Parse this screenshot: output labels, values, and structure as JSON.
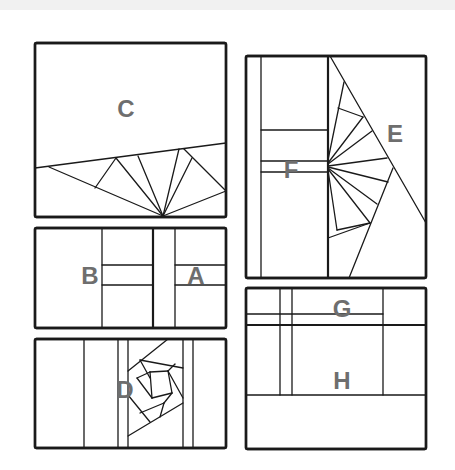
{
  "colors": {
    "stroke": "#1a1a1a",
    "label": "#6e6e6e",
    "background": "#ffffff",
    "top_band": "#f1f1f1"
  },
  "panels": [
    {
      "id": "panel-c",
      "frame": [
        35,
        43,
        191,
        174
      ],
      "labels": [
        {
          "text": "C",
          "x": 126,
          "y": 108
        }
      ],
      "thick_lines": [],
      "lines": [
        [
          35,
          168,
          226,
          143
        ],
        [
          49,
          167,
          163,
          216
        ],
        [
          116,
          158,
          95,
          188
        ],
        [
          116,
          158,
          163,
          216
        ],
        [
          138,
          156,
          163,
          216
        ],
        [
          179,
          149,
          163,
          216
        ],
        [
          184,
          149,
          226,
          191
        ],
        [
          192,
          158,
          163,
          216
        ],
        [
          163,
          216,
          226,
          191
        ]
      ]
    },
    {
      "id": "panel-b-a",
      "frame": [
        35,
        228,
        191,
        100
      ],
      "labels": [
        {
          "text": "B",
          "x": 90,
          "y": 275
        },
        {
          "text": "A",
          "x": 196,
          "y": 275
        }
      ],
      "thick_lines": [
        [
          153,
          228,
          153,
          328
        ]
      ],
      "lines": [
        [
          102,
          228,
          102,
          328
        ],
        [
          175,
          228,
          175,
          328
        ],
        [
          102,
          265,
          153,
          265
        ],
        [
          102,
          285,
          153,
          285
        ],
        [
          175,
          265,
          226,
          265
        ],
        [
          175,
          285,
          226,
          285
        ]
      ]
    },
    {
      "id": "panel-d",
      "frame": [
        35,
        339,
        191,
        109
      ],
      "labels": [
        {
          "text": "D",
          "x": 125,
          "y": 389
        }
      ],
      "thick_lines": [],
      "lines": [
        [
          84,
          339,
          84,
          448
        ],
        [
          118,
          339,
          118,
          448
        ],
        [
          128,
          339,
          128,
          448
        ],
        [
          183,
          339,
          183,
          448
        ],
        [
          193,
          339,
          193,
          448
        ],
        [
          128,
          371,
          168,
          339
        ],
        [
          140,
          360,
          183,
          368
        ],
        [
          140,
          360,
          150,
          378
        ],
        [
          150,
          372,
          168,
          371
        ],
        [
          168,
          371,
          183,
          398
        ],
        [
          175,
          364,
          168,
          371
        ],
        [
          137,
          378,
          150,
          372
        ],
        [
          137,
          378,
          152,
          398
        ],
        [
          150,
          372,
          152,
          398
        ],
        [
          152,
          398,
          172,
          393
        ],
        [
          168,
          371,
          172,
          393
        ],
        [
          172,
          393,
          164,
          403
        ],
        [
          128,
          395,
          150,
          422
        ],
        [
          140,
          413,
          164,
          403
        ],
        [
          164,
          403,
          160,
          417
        ],
        [
          128,
          436,
          183,
          403
        ]
      ]
    },
    {
      "id": "panel-f-e",
      "frame": [
        246,
        56,
        180,
        222
      ],
      "labels": [
        {
          "text": "F",
          "x": 291,
          "y": 169
        },
        {
          "text": "E",
          "x": 395,
          "y": 133
        }
      ],
      "thick_lines": [
        [
          328,
          56,
          328,
          278
        ]
      ],
      "lines": [
        [
          261,
          56,
          261,
          278
        ],
        [
          261,
          130,
          328,
          130
        ],
        [
          261,
          161,
          328,
          161
        ],
        [
          261,
          172,
          328,
          172
        ],
        [
          330,
          56,
          426,
          223
        ],
        [
          349,
          278,
          393,
          168
        ],
        [
          344,
          82,
          328,
          160
        ],
        [
          338,
          108,
          363,
          117
        ],
        [
          363,
          117,
          328,
          163
        ],
        [
          372,
          131,
          328,
          164
        ],
        [
          387,
          158,
          328,
          166
        ],
        [
          328,
          167,
          388,
          182
        ],
        [
          328,
          168,
          377,
          204
        ],
        [
          328,
          169,
          370,
          223
        ],
        [
          328,
          170,
          337,
          230
        ],
        [
          337,
          230,
          370,
          223
        ],
        [
          328,
          238,
          370,
          223
        ]
      ]
    },
    {
      "id": "panel-g-h",
      "frame": [
        246,
        288,
        180,
        161
      ],
      "labels": [
        {
          "text": "G",
          "x": 342,
          "y": 308
        },
        {
          "text": "H",
          "x": 342,
          "y": 380
        }
      ],
      "thick_lines": [
        [
          246,
          325,
          426,
          325
        ]
      ],
      "lines": [
        [
          246,
          314,
          383,
          314
        ],
        [
          280,
          288,
          280,
          395
        ],
        [
          292,
          288,
          292,
          395
        ],
        [
          383,
          288,
          383,
          395
        ],
        [
          246,
          395,
          426,
          395
        ]
      ]
    }
  ]
}
